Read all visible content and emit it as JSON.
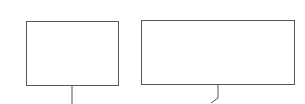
{
  "diagram": {
    "stroke_color": "#555555",
    "background": "#ffffff",
    "nodes": [
      {
        "id": "box-left",
        "label": "",
        "x": 26,
        "y": 21,
        "width": 93,
        "height": 65
      },
      {
        "id": "box-right",
        "label": "",
        "x": 141,
        "y": 20,
        "width": 154,
        "height": 65
      }
    ],
    "connectors": [
      {
        "from": "box-left",
        "points": [
          [
            72,
            86
          ],
          [
            72,
            104
          ]
        ]
      },
      {
        "from": "box-right",
        "points": [
          [
            218,
            85
          ],
          [
            218,
            98
          ],
          [
            211,
            103
          ]
        ]
      }
    ]
  }
}
